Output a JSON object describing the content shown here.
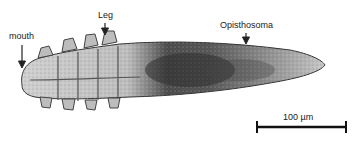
{
  "figure": {
    "annotations": [
      {
        "id": "mouth",
        "label": "mouth"
      },
      {
        "id": "leg",
        "label": "Leg"
      },
      {
        "id": "opisthosoma",
        "label": "Opisthosoma"
      }
    ],
    "scale_bar": {
      "label": "100 µm",
      "value": 100,
      "unit": "µm"
    },
    "colors": {
      "ink": "#222222",
      "body_light": "#d8d8d8",
      "body_dark": "#3a3a3a",
      "background": "#ffffff"
    }
  }
}
